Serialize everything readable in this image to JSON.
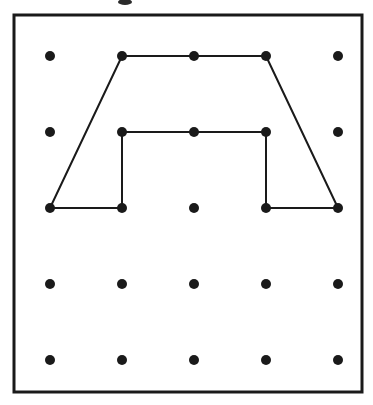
{
  "figure": {
    "kind": "geoboard-pegboard-diagram",
    "title": "",
    "caption": "",
    "background_color": "#ffffff",
    "ink_color": "#1a1a1a"
  },
  "board": {
    "frame": {
      "x": 14,
      "y": 15,
      "width": 348,
      "height": 377,
      "stroke_width": 3,
      "stroke_color": "#1a1a1a",
      "fill_color": "#ffffff"
    },
    "grid": {
      "rows": 5,
      "cols": 5,
      "origin_x": 50,
      "origin_y": 56,
      "spacing_x": 72,
      "spacing_y": 76,
      "dot_radius": 5,
      "dot_color": "#1a1a1a"
    },
    "dots": [
      {
        "row": 0,
        "col": 0,
        "x": 50,
        "y": 56
      },
      {
        "row": 0,
        "col": 1,
        "x": 122,
        "y": 56
      },
      {
        "row": 0,
        "col": 2,
        "x": 194,
        "y": 56
      },
      {
        "row": 0,
        "col": 3,
        "x": 266,
        "y": 56
      },
      {
        "row": 0,
        "col": 4,
        "x": 338,
        "y": 56
      },
      {
        "row": 1,
        "col": 0,
        "x": 50,
        "y": 132
      },
      {
        "row": 1,
        "col": 1,
        "x": 122,
        "y": 132
      },
      {
        "row": 1,
        "col": 2,
        "x": 194,
        "y": 132
      },
      {
        "row": 1,
        "col": 3,
        "x": 266,
        "y": 132
      },
      {
        "row": 1,
        "col": 4,
        "x": 338,
        "y": 132
      },
      {
        "row": 2,
        "col": 0,
        "x": 50,
        "y": 208
      },
      {
        "row": 2,
        "col": 1,
        "x": 122,
        "y": 208
      },
      {
        "row": 2,
        "col": 2,
        "x": 194,
        "y": 208
      },
      {
        "row": 2,
        "col": 3,
        "x": 266,
        "y": 208
      },
      {
        "row": 2,
        "col": 4,
        "x": 338,
        "y": 208
      },
      {
        "row": 3,
        "col": 0,
        "x": 50,
        "y": 284
      },
      {
        "row": 3,
        "col": 1,
        "x": 122,
        "y": 284
      },
      {
        "row": 3,
        "col": 2,
        "x": 194,
        "y": 284
      },
      {
        "row": 3,
        "col": 3,
        "x": 266,
        "y": 284
      },
      {
        "row": 3,
        "col": 4,
        "x": 338,
        "y": 284
      },
      {
        "row": 4,
        "col": 0,
        "x": 50,
        "y": 360
      },
      {
        "row": 4,
        "col": 1,
        "x": 122,
        "y": 360
      },
      {
        "row": 4,
        "col": 2,
        "x": 194,
        "y": 360
      },
      {
        "row": 4,
        "col": 3,
        "x": 266,
        "y": 360
      },
      {
        "row": 4,
        "col": 4,
        "x": 338,
        "y": 360
      }
    ]
  },
  "shapes": [
    {
      "name": "outer-trapezoid",
      "closed": false,
      "stroke_width": 2,
      "points": "50,208 122,56 266,56 338,208",
      "vertices": [
        {
          "x": 50,
          "y": 208,
          "row": 2,
          "col": 0
        },
        {
          "x": 122,
          "y": 56,
          "row": 0,
          "col": 1
        },
        {
          "x": 266,
          "y": 56,
          "row": 0,
          "col": 3
        },
        {
          "x": 338,
          "y": 208,
          "row": 2,
          "col": 4
        }
      ]
    },
    {
      "name": "inner-rectangle-base",
      "closed": false,
      "stroke_width": 2,
      "points": "50,208 122,208 122,132 266,132 266,208 338,208",
      "vertices": [
        {
          "x": 50,
          "y": 208,
          "row": 2,
          "col": 0
        },
        {
          "x": 122,
          "y": 208,
          "row": 2,
          "col": 1
        },
        {
          "x": 122,
          "y": 132,
          "row": 1,
          "col": 1
        },
        {
          "x": 266,
          "y": 132,
          "row": 1,
          "col": 3
        },
        {
          "x": 266,
          "y": 208,
          "row": 2,
          "col": 3
        },
        {
          "x": 338,
          "y": 208,
          "row": 2,
          "col": 4
        }
      ]
    }
  ],
  "artifacts": [
    {
      "name": "top-edge-smudge",
      "x": 125,
      "y": 2,
      "rx": 7,
      "ry": 3
    }
  ]
}
